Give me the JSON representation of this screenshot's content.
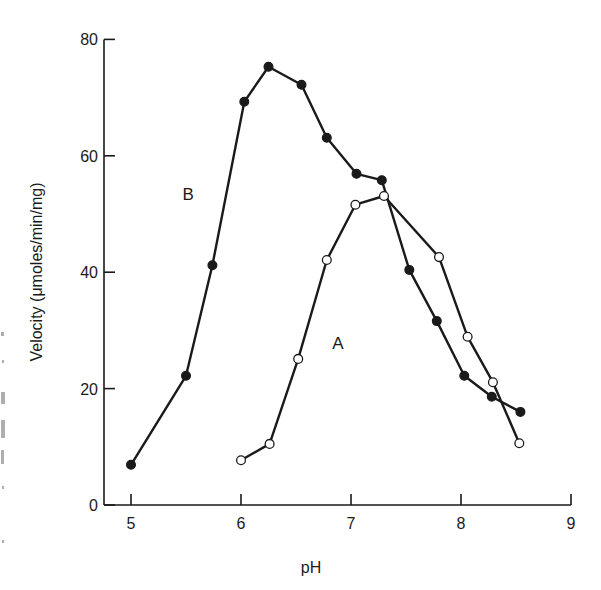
{
  "chart_data": {
    "type": "line",
    "title": "",
    "xlabel": "pH",
    "ylabel": "Velocity (μmoles/min/mg)",
    "xlim": [
      4.8,
      9
    ],
    "ylim": [
      0,
      80
    ],
    "x_ticks": [
      5,
      6,
      7,
      8,
      9
    ],
    "y_ticks": [
      0,
      20,
      40,
      60,
      80
    ],
    "x_tick_labels": [
      "5",
      "6",
      "7",
      "8",
      "9"
    ],
    "y_tick_labels": [
      "0",
      "20",
      "40",
      "60",
      "80"
    ],
    "grid": false,
    "legend": "none (curves labeled inline)",
    "annotations": [
      {
        "text": "B",
        "x": 5.52,
        "y": 53.5
      },
      {
        "text": "A",
        "x": 6.88,
        "y": 27.8
      }
    ],
    "series": [
      {
        "name": "B",
        "marker": "filled-circle",
        "x": [
          5.0,
          5.5,
          5.74,
          6.03,
          6.25,
          6.55,
          6.78,
          7.05,
          7.28,
          7.53,
          7.78,
          8.03,
          8.28,
          8.54
        ],
        "y": [
          6.9,
          22.2,
          41.2,
          69.3,
          75.3,
          72.2,
          63.1,
          56.9,
          55.8,
          40.4,
          31.6,
          22.2,
          18.6,
          16.0
        ]
      },
      {
        "name": "A",
        "marker": "open-circle",
        "x": [
          6.0,
          6.26,
          6.52,
          6.78,
          7.04,
          7.3,
          7.8,
          8.06,
          8.29,
          8.53
        ],
        "y": [
          7.7,
          10.5,
          25.1,
          42.1,
          51.6,
          53.1,
          42.6,
          28.9,
          21.1,
          10.6
        ]
      }
    ]
  },
  "labels": {
    "x_axis_title": "pH",
    "y_axis_title": "Velocity (μmoles/min/mg)",
    "curve_b": "B",
    "curve_a": "A"
  }
}
